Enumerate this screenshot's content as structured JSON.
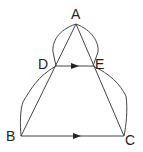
{
  "diagram": {
    "type": "geometry",
    "points": {
      "A": {
        "label": "A",
        "x": 76,
        "y": 24
      },
      "D": {
        "label": "D",
        "x": 56,
        "y": 66
      },
      "E": {
        "label": "E",
        "x": 93,
        "y": 66
      },
      "B": {
        "label": "B",
        "x": 21,
        "y": 136
      },
      "C": {
        "label": "C",
        "x": 124,
        "y": 136
      }
    },
    "segments": [
      "AB",
      "AC",
      "DE",
      "BC"
    ],
    "parallel_marks": [
      "DE",
      "BC"
    ],
    "arcs": [
      "A-D",
      "A-E",
      "D-B",
      "E-C"
    ],
    "colors": {
      "stroke": "#333333",
      "text": "#222222"
    }
  }
}
